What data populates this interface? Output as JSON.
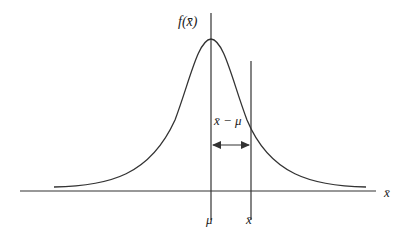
{
  "diagram": {
    "type": "normal-distribution-deviation",
    "y_axis_label": "f(x̄)",
    "x_axis_label": "x̄",
    "ticks": [
      {
        "label": "μ",
        "position": "mean"
      },
      {
        "label": "x̄",
        "position": "sample mean"
      }
    ],
    "deviation_label": "x̄ − μ",
    "colors": {
      "line": "#333333",
      "text": "#222222",
      "background": "#ffffff"
    }
  }
}
